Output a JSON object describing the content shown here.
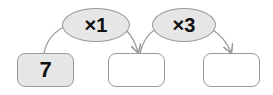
{
  "operators": [
    {
      "label": "×1"
    },
    {
      "label": "×3"
    }
  ],
  "boxes": [
    {
      "value": "7",
      "filled": true
    },
    {
      "value": "",
      "filled": false
    },
    {
      "value": "",
      "filled": false
    }
  ],
  "colors": {
    "fill": "#e6e6e6",
    "stroke": "#9a9a9a"
  }
}
